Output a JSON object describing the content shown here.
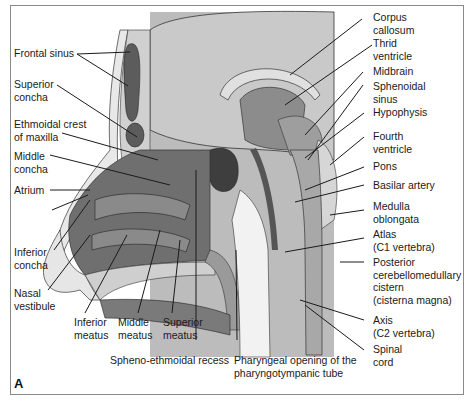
{
  "figure": {
    "panel_letter": "A",
    "colors": {
      "brain": "#c4c4c4",
      "dark_tissue": "#6f6f6f",
      "mid_tissue": "#9a9a9a",
      "light_tissue": "#dcdcdc",
      "sinus": "#4a4a4a",
      "airway": "#f4f4f4",
      "line": "#1a1a1a"
    },
    "labels_left": [
      {
        "id": "frontal-sinus",
        "text": "Frontal sinus"
      },
      {
        "id": "superior-concha",
        "text": "Superior\nconcha"
      },
      {
        "id": "ethmoidal-crest",
        "text": "Ethmoidal crest\nof maxilla"
      },
      {
        "id": "middle-concha",
        "text": "Middle\nconcha"
      },
      {
        "id": "atrium",
        "text": "Atrium"
      },
      {
        "id": "inferior-concha",
        "text": "Inferior\nconcha"
      },
      {
        "id": "nasal-vestibule",
        "text": "Nasal\nvestibule"
      }
    ],
    "labels_bottom": [
      {
        "id": "inferior-meatus",
        "text": "Inferior\nmeatus"
      },
      {
        "id": "middle-meatus",
        "text": "Middle\nmeatus"
      },
      {
        "id": "superior-meatus",
        "text": "Superior\nmeatus"
      },
      {
        "id": "spheno-ethmoidal-recess",
        "text": "Spheno-ethmoidal recess"
      },
      {
        "id": "pharyngeal-opening",
        "text": "Pharyngeal opening of the\npharyngotympanic tube"
      }
    ],
    "labels_right": [
      {
        "id": "corpus-callosum",
        "text": "Corpus\ncallosum"
      },
      {
        "id": "third-ventricle",
        "text": "Thrid\nventricle"
      },
      {
        "id": "midbrain",
        "text": "Midbrain"
      },
      {
        "id": "sphenoidal-sinus",
        "text": "Sphenoidal\nsinus"
      },
      {
        "id": "hypophysis",
        "text": "Hypophysis"
      },
      {
        "id": "fourth-ventricle",
        "text": "Fourth\nventricle"
      },
      {
        "id": "pons",
        "text": "Pons"
      },
      {
        "id": "basilar-artery",
        "text": "Basilar artery"
      },
      {
        "id": "medulla-oblongata",
        "text": "Medulla\noblongata"
      },
      {
        "id": "atlas",
        "text": "Atlas\n(C1 vertebra)"
      },
      {
        "id": "posterior-cistern",
        "text": "Posterior\ncerebellomedullary\ncistern\n(cisterna magna)"
      },
      {
        "id": "axis",
        "text": "Axis\n(C2 vertebra)"
      },
      {
        "id": "spinal-cord",
        "text": "Spinal\ncord"
      }
    ]
  }
}
